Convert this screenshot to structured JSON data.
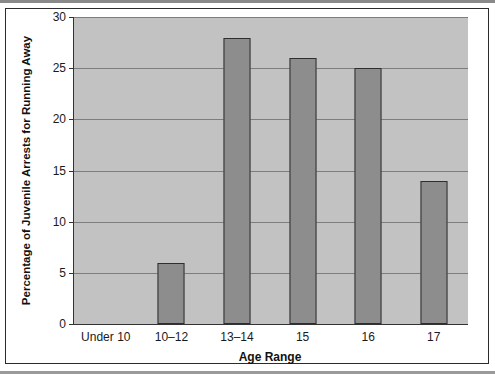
{
  "chart_data": {
    "type": "bar",
    "title": "",
    "subtitle": "",
    "xlabel": "Age Range",
    "ylabel": "Percentage of Juvenile Arrests for Running Away",
    "categories": [
      "Under 10",
      "10–12",
      "13–14",
      "15",
      "16",
      "17"
    ],
    "values": [
      0,
      6,
      28,
      26,
      25,
      14
    ],
    "series": [
      {
        "name": "Percentage of Juvenile Arrests for Running Away",
        "values": [
          0,
          6,
          28,
          26,
          25,
          14
        ]
      }
    ],
    "ylim": [
      0,
      30
    ],
    "ytick_labels": [
      "30",
      "25",
      "20",
      "15",
      "10",
      "5",
      "0"
    ],
    "yticks": [
      30,
      25,
      20,
      15,
      10,
      5,
      0
    ],
    "grid": "horizontal",
    "legend": "none",
    "annotations": [],
    "colors": {
      "bar_fill": "#8d8d8d",
      "bar_edge": "#2e2e2e",
      "plot_background": "#c2c2c2",
      "gridline": "#7d7d7d",
      "axis": "#333333",
      "text": "#1a1a1a",
      "frame": "#2b2b2b",
      "page_background": "#ffffff"
    }
  }
}
